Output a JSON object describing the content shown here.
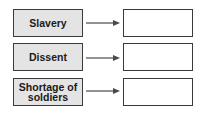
{
  "diagram": {
    "rows": [
      {
        "cause": "Slavery",
        "effect": ""
      },
      {
        "cause": "Dissent",
        "effect": ""
      },
      {
        "cause": "Shortage of\nsoldiers",
        "effect": ""
      }
    ],
    "colors": {
      "cause_fill": "#e4e4e4",
      "border": "#3a3a3a",
      "arrow": "#4a4a4a",
      "answer_fill": "#ffffff"
    }
  }
}
